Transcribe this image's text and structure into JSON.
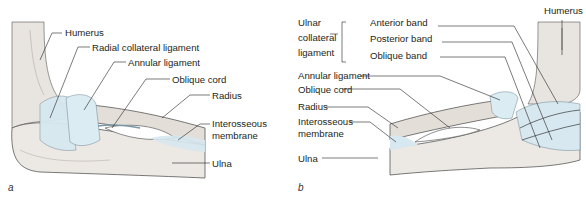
{
  "figure": {
    "panels": [
      {
        "id": "a",
        "panel_label": "a",
        "labels": {
          "humerus": "Humerus",
          "radial_collateral": "Radial collateral ligament",
          "annular": "Annular ligament",
          "oblique_cord": "Oblique cord",
          "radius": "Radius",
          "interosseous_1": "Interosseous",
          "interosseous_2": "membrane",
          "ulna": "Ulna"
        }
      },
      {
        "id": "b",
        "panel_label": "b",
        "labels": {
          "humerus": "Humerus",
          "ucl_1": "Ulnar",
          "ucl_2": "collateral",
          "ucl_3": "ligament",
          "anterior_band": "Anterior band",
          "posterior_band": "Posterior band",
          "oblique_band": "Oblique band",
          "annular": "Annular ligament",
          "oblique_cord": "Oblique cord",
          "radius": "Radius",
          "interosseous_1": "Interosseous",
          "interosseous_2": "membrane",
          "ulna": "Ulna"
        }
      }
    ]
  },
  "colors": {
    "bone": "#e8e4df",
    "bone_shadow": "#d6d0ca",
    "ligament": "#d7e8f0",
    "outline": "#3a3a3a",
    "text": "#231f20"
  }
}
